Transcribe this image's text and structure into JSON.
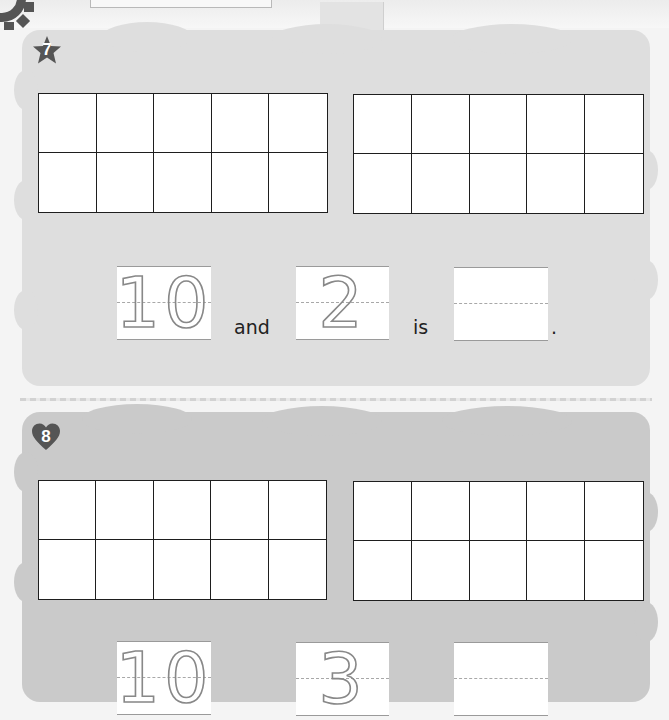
{
  "page": {
    "background": "#f4f4f4"
  },
  "sections": [
    {
      "number": "7",
      "badge_shape": "star",
      "badge_color": "#555555",
      "background": "#dedede",
      "ten_frames": [
        {
          "rows": 2,
          "cols": 5,
          "filled": []
        },
        {
          "rows": 2,
          "cols": 5,
          "filled": []
        }
      ],
      "sentence": {
        "first_addend": "10",
        "connector": "and",
        "second_addend": "2",
        "verb": "is",
        "answer": "",
        "ending": "."
      }
    },
    {
      "number": "8",
      "badge_shape": "heart",
      "badge_color": "#555555",
      "background": "#cacaca",
      "ten_frames": [
        {
          "rows": 2,
          "cols": 5,
          "filled": []
        },
        {
          "rows": 2,
          "cols": 5,
          "filled": []
        }
      ],
      "sentence": {
        "first_addend": "10",
        "second_addend": "3",
        "answer": ""
      }
    }
  ],
  "icons": {
    "corner": "gear-icon",
    "section7": "star-icon",
    "section8": "heart-icon"
  }
}
